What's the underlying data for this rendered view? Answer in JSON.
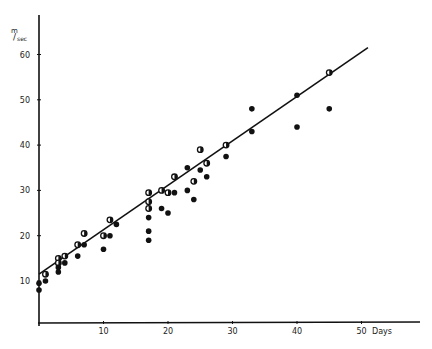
{
  "chart_data": {
    "type": "scatter",
    "title": "",
    "xlabel": "Days",
    "ylabel": "m/sec",
    "ylabel_parts": {
      "num": "m",
      "den": "sec"
    },
    "xlim": [
      0,
      55
    ],
    "ylim": [
      5,
      65
    ],
    "x_ticks": [
      10,
      20,
      30,
      40,
      50
    ],
    "y_ticks": [
      10,
      20,
      30,
      40,
      50,
      60
    ],
    "grid": false,
    "legend": null,
    "series": [
      {
        "name": "observations",
        "marker": "circle",
        "points": [
          [
            0,
            9.5,
            "filled"
          ],
          [
            0,
            8,
            "filled"
          ],
          [
            1,
            11.5,
            "half"
          ],
          [
            1,
            10,
            "filled"
          ],
          [
            3,
            15,
            "half"
          ],
          [
            3,
            14,
            "half"
          ],
          [
            3,
            13,
            "filled"
          ],
          [
            3,
            12,
            "filled"
          ],
          [
            4,
            15.5,
            "half"
          ],
          [
            4,
            14,
            "filled"
          ],
          [
            6,
            18,
            "half"
          ],
          [
            6,
            15.5,
            "filled"
          ],
          [
            7,
            20.5,
            "half"
          ],
          [
            7,
            18,
            "filled"
          ],
          [
            10,
            20,
            "half"
          ],
          [
            10,
            17,
            "filled"
          ],
          [
            11,
            23.5,
            "half"
          ],
          [
            11,
            20,
            "filled"
          ],
          [
            12,
            22.5,
            "filled"
          ],
          [
            17,
            29.5,
            "half"
          ],
          [
            17,
            27.5,
            "half"
          ],
          [
            17,
            26,
            "half"
          ],
          [
            17,
            24,
            "filled"
          ],
          [
            17,
            21,
            "filled"
          ],
          [
            17,
            19,
            "filled"
          ],
          [
            19,
            30,
            "half"
          ],
          [
            19,
            26,
            "filled"
          ],
          [
            20,
            29.5,
            "half"
          ],
          [
            20,
            25,
            "filled"
          ],
          [
            21,
            33,
            "half"
          ],
          [
            21,
            29.5,
            "filled"
          ],
          [
            23,
            35,
            "filled"
          ],
          [
            23,
            30,
            "filled"
          ],
          [
            24,
            32,
            "half"
          ],
          [
            24,
            28,
            "filled"
          ],
          [
            25,
            39,
            "half"
          ],
          [
            25,
            34.5,
            "filled"
          ],
          [
            26,
            36,
            "half"
          ],
          [
            26,
            33,
            "filled"
          ],
          [
            29,
            40,
            "half"
          ],
          [
            29,
            37.5,
            "filled"
          ],
          [
            33,
            48,
            "filled"
          ],
          [
            33,
            43,
            "filled"
          ],
          [
            40,
            51,
            "filled"
          ],
          [
            40,
            44,
            "filled"
          ],
          [
            45,
            56,
            "half"
          ],
          [
            45,
            48,
            "filled"
          ]
        ]
      }
    ],
    "trend_line": {
      "x": [
        0,
        51
      ],
      "y": [
        11.5,
        61.5
      ]
    }
  }
}
